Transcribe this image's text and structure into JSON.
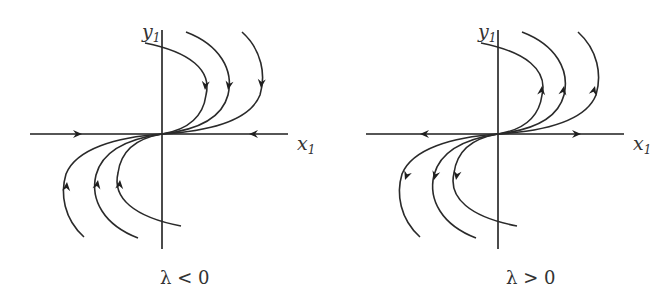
{
  "panels": [
    {
      "caption": "λ < 0",
      "x_axis_label": "x",
      "x_axis_sub": "1",
      "y_axis_label": "y",
      "y_axis_sub": "1",
      "flow_direction": "toward origin"
    },
    {
      "caption": "λ > 0",
      "x_axis_label": "x",
      "x_axis_sub": "1",
      "y_axis_label": "y",
      "y_axis_sub": "1",
      "flow_direction": "away from origin"
    }
  ],
  "colors": {
    "stroke": "#2a2a2a",
    "background": "#ffffff"
  }
}
